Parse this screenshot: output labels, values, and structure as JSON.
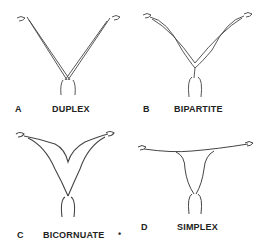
{
  "diagram": {
    "panels": [
      {
        "letter": "A",
        "name": "DUPLEX"
      },
      {
        "letter": "B",
        "name": "BIPARTITE"
      },
      {
        "letter": "C",
        "name": "BICORNUATE"
      },
      {
        "letter": "D",
        "name": "SIMPLEX"
      }
    ],
    "separator_dot": "•",
    "stroke_color": "#444444"
  }
}
